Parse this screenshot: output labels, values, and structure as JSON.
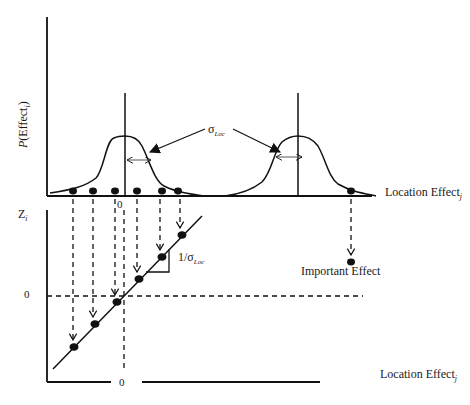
{
  "labels": {
    "p_effect_prefix": "P",
    "p_effect_body": "(Effect",
    "p_effect_sub": "i",
    "p_effect_close": ")",
    "sigma_symbol": "σ",
    "sigma_sub": "Loc",
    "location_effect_top": "Location Effect",
    "location_effect_top_sub": "j",
    "location_effect_bottom": "Location Effect",
    "location_effect_bottom_sub": "j",
    "important_effect": "Important Effect",
    "z_axis": "Z",
    "z_axis_sub": "i",
    "zero_top_x": "0",
    "zero_y": "0",
    "zero_bottom_x": "0",
    "slope_prefix": "1/σ",
    "slope_sub": "Loc"
  },
  "upper_panel": {
    "axis_origin": [
      47,
      196
    ],
    "axis_top_y": 17,
    "baseline_end_x": 372,
    "null_distribution_center_x": 125,
    "shifted_distribution_center_x": 298,
    "null_effect_dots_x": [
      73,
      93,
      115,
      137,
      162,
      178
    ],
    "important_effect_dot_x": 351
  },
  "lower_panel": {
    "axis_origin": [
      47,
      382
    ],
    "axis_top_y": 210,
    "zero_line_y": 296,
    "zero_line_x": 124,
    "probit_points": [
      [
        74,
        347
      ],
      [
        95,
        324
      ],
      [
        117,
        302
      ],
      [
        139,
        279
      ],
      [
        162,
        257
      ],
      [
        182,
        235
      ]
    ],
    "important_point": [
      351,
      262
    ]
  },
  "colors": {
    "ink": "#111111",
    "background": "#ffffff"
  }
}
